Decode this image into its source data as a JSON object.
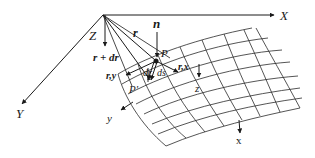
{
  "diagram": {
    "type": "surface-geometry",
    "global_axes": {
      "x_label": "X",
      "y_label": "Y",
      "z_label": "Z"
    },
    "vectors": {
      "position": "r",
      "position_incremented": "r + dr",
      "normal": "n",
      "tangent_x": "r,x",
      "tangent_y": "r,y",
      "differential_position": "dr",
      "arc_length": "ds"
    },
    "points": {
      "p": "P",
      "p_prime": "P'"
    },
    "local_axes": {
      "x_label": "x",
      "y_label": "y",
      "z_label": "z"
    },
    "colors": {
      "ink": "#1a1a1a",
      "background": "#ffffff"
    }
  }
}
